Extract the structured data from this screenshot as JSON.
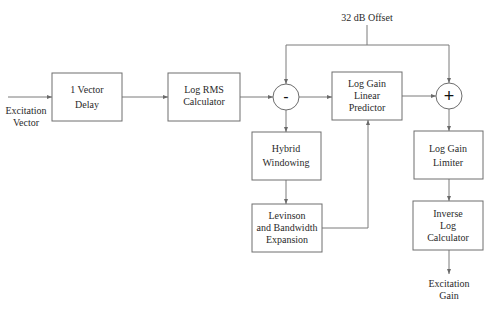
{
  "diagram": {
    "type": "block-diagram",
    "input_label": [
      "Excitation",
      "Vector"
    ],
    "offset_label": "32 dB Offset",
    "output_label": [
      "Excitation",
      "Gain"
    ],
    "blocks": [
      {
        "id": "delay",
        "lines": [
          "1 Vector",
          "Delay"
        ]
      },
      {
        "id": "logrms",
        "lines": [
          "Log RMS",
          "Calculator"
        ]
      },
      {
        "id": "predictor",
        "lines": [
          "Log Gain",
          "Linear",
          "Predictor"
        ]
      },
      {
        "id": "hybrid",
        "lines": [
          "Hybrid",
          "Windowing"
        ]
      },
      {
        "id": "levinson",
        "lines": [
          "Levinson",
          "and Bandwidth",
          "Expansion"
        ]
      },
      {
        "id": "limiter",
        "lines": [
          "Log Gain",
          "Limiter"
        ]
      },
      {
        "id": "invlog",
        "lines": [
          "Inverse",
          "Log",
          "Calculator"
        ]
      }
    ],
    "operators": [
      {
        "id": "subtract",
        "symbol": "-"
      },
      {
        "id": "add",
        "symbol": "+"
      }
    ],
    "edges": [
      {
        "from": "input",
        "to": "delay"
      },
      {
        "from": "delay",
        "to": "logrms"
      },
      {
        "from": "logrms",
        "to": "subtract"
      },
      {
        "from": "offset",
        "to": "subtract"
      },
      {
        "from": "offset",
        "to": "add"
      },
      {
        "from": "subtract",
        "to": "predictor"
      },
      {
        "from": "subtract",
        "to": "hybrid"
      },
      {
        "from": "hybrid",
        "to": "levinson"
      },
      {
        "from": "levinson",
        "to": "predictor"
      },
      {
        "from": "predictor",
        "to": "add"
      },
      {
        "from": "add",
        "to": "limiter"
      },
      {
        "from": "limiter",
        "to": "invlog"
      },
      {
        "from": "invlog",
        "to": "output"
      }
    ]
  }
}
